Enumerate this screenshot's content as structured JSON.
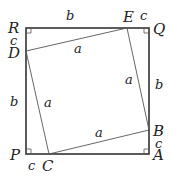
{
  "diagram": {
    "vertices": {
      "outer": [
        "P",
        "A",
        "Q",
        "R"
      ],
      "inner": [
        "C",
        "B",
        "E",
        "D"
      ]
    },
    "labels": {
      "R": "R",
      "Q": "Q",
      "P": "P",
      "A": "A",
      "E": "E",
      "D": "D",
      "C": "C",
      "B": "B"
    },
    "segment_labels": {
      "top_b": "b",
      "top_c": "c",
      "left_c": "c",
      "left_b": "b",
      "right_b": "b",
      "right_c": "c",
      "bottom_c": "c",
      "inner_DE": "a",
      "inner_EB": "a",
      "inner_DC": "a",
      "inner_CB": "a"
    }
  }
}
